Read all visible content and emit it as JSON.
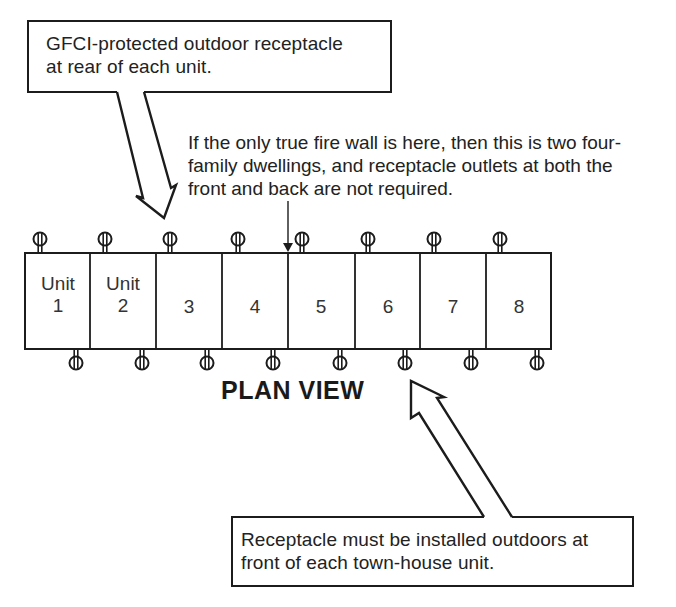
{
  "diagram": {
    "title": "PLAN VIEW",
    "callouts": {
      "rear_receptacle": {
        "line1": "GFCI-protected outdoor receptacle",
        "line2": "at rear of each unit."
      },
      "front_receptacle": {
        "line1": "Receptacle must be installed outdoors at",
        "line2": "front of each town-house unit."
      }
    },
    "fire_wall_note": {
      "line1": "If the only true fire wall is here, then this is two four-",
      "line2": "family dwellings, and receptacle outlets at both the",
      "line3": "front and back are not required."
    },
    "units": [
      {
        "line1": "Unit",
        "line2": "1"
      },
      {
        "line1": "Unit",
        "line2": "2"
      },
      {
        "line1": "",
        "line2": "3"
      },
      {
        "line1": "",
        "line2": "4"
      },
      {
        "line1": "",
        "line2": "5"
      },
      {
        "line1": "",
        "line2": "6"
      },
      {
        "line1": "",
        "line2": "7"
      },
      {
        "line1": "",
        "line2": "8"
      }
    ],
    "icons": {
      "receptacle": "duplex-receptacle-symbol",
      "callout_arrow": "hollow-block-arrow",
      "fire_wall_pointer": "thin-down-arrow"
    },
    "colors": {
      "line": "#1c1c1c",
      "background": "#ffffff"
    }
  }
}
